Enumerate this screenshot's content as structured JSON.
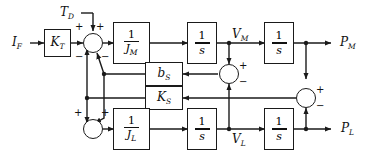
{
  "diagram": {
    "stroke_color": "#1a1a1a",
    "background": "#ffffff"
  },
  "signals": {
    "input_current": {
      "base": "I",
      "sub": "F"
    },
    "disturbance_torque": {
      "base": "T",
      "sub": "D"
    },
    "motor_velocity": {
      "base": "V",
      "sub": "M"
    },
    "load_velocity": {
      "base": "V",
      "sub": "L"
    },
    "motor_position": {
      "base": "P",
      "sub": "M"
    },
    "load_position": {
      "base": "P",
      "sub": "L"
    }
  },
  "blocks": [
    {
      "name": "torque-constant",
      "label": {
        "base": "K",
        "sub": "T"
      },
      "kind": "plain"
    },
    {
      "name": "motor-inertia",
      "label": {
        "num": "1",
        "den": "J",
        "den_sub": "M"
      },
      "kind": "fraction"
    },
    {
      "name": "motor-integrator-1",
      "label": {
        "num": "1",
        "den": "s",
        "den_sub": ""
      },
      "kind": "fraction"
    },
    {
      "name": "motor-integrator-2",
      "label": {
        "num": "1",
        "den": "s",
        "den_sub": ""
      },
      "kind": "fraction"
    },
    {
      "name": "shaft-damping",
      "label": {
        "base": "b",
        "sub": "S"
      },
      "kind": "plain"
    },
    {
      "name": "shaft-stiffness",
      "label": {
        "base": "K",
        "sub": "S"
      },
      "kind": "plain"
    },
    {
      "name": "load-inertia",
      "label": {
        "num": "1",
        "den": "J",
        "den_sub": "L"
      },
      "kind": "fraction"
    },
    {
      "name": "load-integrator-1",
      "label": {
        "num": "1",
        "den": "s",
        "den_sub": ""
      },
      "kind": "fraction"
    },
    {
      "name": "load-integrator-2",
      "label": {
        "num": "1",
        "den": "s",
        "den_sub": ""
      },
      "kind": "fraction"
    }
  ],
  "summing_junctions": [
    {
      "name": "motor-torque-summer",
      "signs": [
        "+",
        "+",
        "-",
        "-"
      ]
    },
    {
      "name": "load-torque-summer",
      "signs": [
        "+",
        "+"
      ]
    },
    {
      "name": "velocity-difference-summer",
      "signs": [
        "+",
        "-"
      ]
    },
    {
      "name": "position-difference-summer",
      "signs": [
        "+",
        "-"
      ]
    }
  ],
  "signs": {
    "plus": "+",
    "minus": "−"
  }
}
